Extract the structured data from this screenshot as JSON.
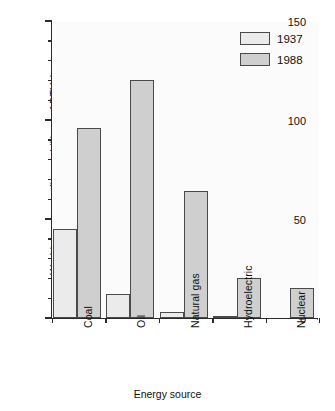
{
  "chart_data": {
    "type": "bar",
    "title": "",
    "xlabel": "Energy source",
    "ylabel": "World energy use (in quadrillions of BTUs)",
    "categories": [
      "Coal",
      "Oil",
      "Natural gas",
      "Hydroelectric",
      "Nuclear"
    ],
    "series": [
      {
        "name": "1937",
        "values": [
          45,
          12,
          3,
          1,
          0
        ]
      },
      {
        "name": "1988",
        "values": [
          96,
          120,
          64,
          20,
          15
        ]
      }
    ],
    "ylim": [
      0,
      150
    ],
    "yticks_major": [
      0,
      50,
      100,
      150
    ],
    "ytick_minor_step": 10,
    "grid": false,
    "legend_position": "top-right",
    "colors": {
      "series_1937": "#ebebeb",
      "series_1988": "#cfcfcf",
      "bar_edge": "#4a4a4a",
      "axis": "#2b2b2b",
      "background": "#ffffff",
      "plot_background": "#fbfbfb"
    }
  },
  "legend": {
    "entries": [
      {
        "label": "1937"
      },
      {
        "label": "1988"
      }
    ]
  },
  "axis": {
    "y_tick_labels": [
      "150",
      "100",
      "50",
      "0"
    ]
  }
}
